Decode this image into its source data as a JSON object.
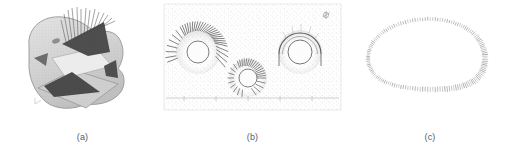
{
  "figure": {
    "background_color": "#ffffff",
    "ink_color": "#595959",
    "panels": [
      {
        "id": "a",
        "caption": "(a)",
        "subject": "3d-triangulated-surface-mesh-with-normal-vectors",
        "description": "Shaded three-dimensional polyhedral surface with dark shaded triangular facets and a sheaf of thin hair-like normal vectors emerging from the upper dark facet.",
        "fill_light": "#d8d8d8",
        "fill_mid": "#b5b5b5",
        "fill_dark": "#4a4a4a",
        "outline": "#8a8a8a",
        "hair_count": 14
      },
      {
        "id": "b",
        "caption": "(b)",
        "subject": "three-tunnel-cross-sections-on-speckled-background-mesh",
        "description": "Three circular tunnel cross-sections embedded in a speckled unstructured background mesh, with a faint horizontal ground line and tick marks near the bottom and a small orientation marker at the upper right.",
        "background_speckle": "#b9b9b9",
        "ground_line_color": "#a9a9a9",
        "corner_marker": "orientation-marker",
        "tunnels": [
          {
            "label": "tunnel-left",
            "cx": 38,
            "cy": 52,
            "r": 11,
            "ray_style": "dense-radial-fan",
            "ray_count": 34,
            "arc_span_deg": 200,
            "ray_length": 11
          },
          {
            "label": "tunnel-middle",
            "cx": 88,
            "cy": 78,
            "r": 9,
            "ray_style": "dense-radial-fan",
            "ray_count": 30,
            "arc_span_deg": 300,
            "ray_length": 9
          },
          {
            "label": "tunnel-right",
            "cx": 140,
            "cy": 52,
            "r": 12,
            "ray_style": "thin-outline-arc",
            "ray_count": 0,
            "arc_span_deg": 190,
            "ray_length": 8
          }
        ]
      },
      {
        "id": "c",
        "caption": "(c)",
        "subject": "closed-egg-shaped-boundary-of-tick-marks",
        "description": "Closed egg-shaped (oval with flattened bottom) curve drawn as a dense sequence of short tick marks / hatches aligned to the local boundary normal.",
        "tick_color": "#9a9a9a",
        "tick_count": 150,
        "shape": "egg-oval-flat-bottom",
        "center_x": 84,
        "center_y": 58,
        "radius_x": 60,
        "radius_y": 38
      }
    ]
  }
}
